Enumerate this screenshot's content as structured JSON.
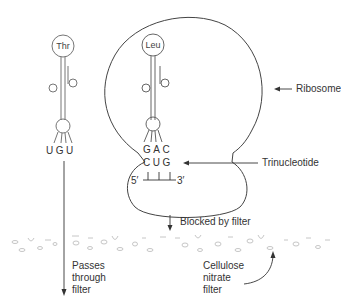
{
  "diagram": {
    "trna_left": {
      "amino_acid": "Thr",
      "anticodon": "UGU"
    },
    "trna_right": {
      "amino_acid": "Leu",
      "anticodon": "GAC"
    },
    "trinucleotide": {
      "codon": "CUG",
      "five_prime": "5′",
      "three_prime": "3′"
    },
    "labels": {
      "ribosome": "Ribosome",
      "trinucleotide": "Trinucleotide",
      "blocked": "Blocked by filter",
      "passes": "Passes through filter",
      "filter": "Cellulose nitrate filter"
    },
    "colors": {
      "line": "#444444",
      "filter_texture": "#b8b8b8"
    }
  }
}
